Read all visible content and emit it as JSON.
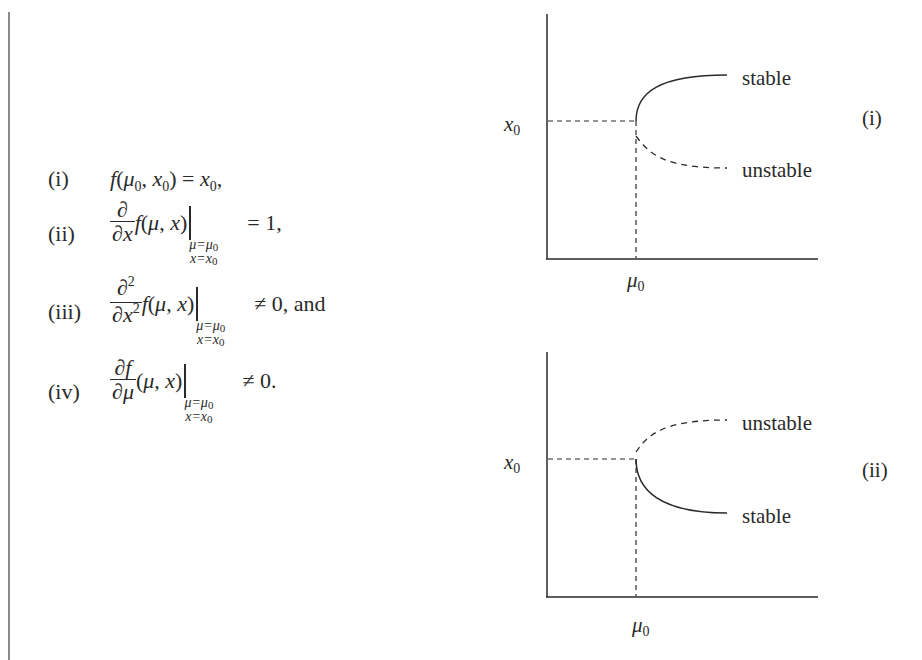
{
  "conditions": {
    "items": [
      {
        "label": "(i)",
        "expression": "f(μ0, x0) = x0,"
      },
      {
        "label": "(ii)",
        "expression": "∂/∂x f(μ, x) |_{μ=μ0, x=x0} = 1,"
      },
      {
        "label": "(iii)",
        "expression": "∂²/∂x² f(μ, x) |_{μ=μ0, x=x0} ≠ 0, and"
      },
      {
        "label": "(iv)",
        "expression": "∂f/∂μ (μ, x) |_{μ=μ0, x=x0} ≠ 0."
      }
    ],
    "parts": {
      "f": "f",
      "mu": "μ",
      "x": "x",
      "zero": "0",
      "partial": "∂",
      "two": "2",
      "eval_mu": "μ=μ",
      "eval_x": "x=x",
      "rhs_i": " = ",
      "rhs_ii": "= 1,",
      "rhs_iii": "≠ 0, and",
      "rhs_iv": "≠ 0."
    }
  },
  "diagrams": [
    {
      "id": "i",
      "tag": "(i)",
      "y_axis_label": "x",
      "y_axis_sub": "0",
      "x_axis_label": "μ",
      "x_axis_sub": "0",
      "upper_branch_label": "stable",
      "lower_branch_label": "unstable",
      "upper_branch_style": "solid",
      "lower_branch_style": "dashed"
    },
    {
      "id": "ii",
      "tag": "(ii)",
      "y_axis_label": "x",
      "y_axis_sub": "0",
      "x_axis_label": "μ",
      "x_axis_sub": "0",
      "upper_branch_label": "unstable",
      "lower_branch_label": "stable",
      "upper_branch_style": "dashed",
      "lower_branch_style": "solid"
    }
  ],
  "colors": {
    "ink": "#2a2a2a",
    "margin_bar": "#8a8a8a",
    "background": "#ffffff"
  }
}
